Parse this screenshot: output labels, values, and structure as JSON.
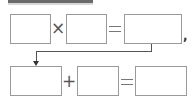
{
  "diagram": {
    "type": "equation-chain",
    "row1": {
      "boxes": [
        "",
        "",
        ""
      ],
      "operator": "×",
      "equals": "=",
      "trailing": ","
    },
    "row2": {
      "boxes": [
        "",
        "",
        ""
      ],
      "operator": "+",
      "equals": "="
    },
    "connector": "arrow from row1 result box to row2 first box"
  }
}
